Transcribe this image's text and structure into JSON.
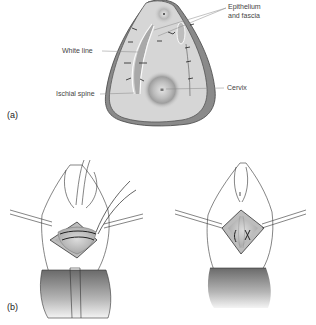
{
  "figure": {
    "panel_a": {
      "label": "(a)",
      "annotations": {
        "epithelium_line1": "Epithelium",
        "epithelium_line2": "and fascia",
        "white_line": "White line",
        "ischial_spine": "Ischial spine",
        "cervix": "Cervix"
      }
    },
    "panel_b": {
      "label": "(b)"
    }
  },
  "colors": {
    "tissue_fill": "#d6d6d6",
    "outline": "#555555",
    "shadow_edge": "#8a8a8a",
    "leader_line": "#888888"
  }
}
